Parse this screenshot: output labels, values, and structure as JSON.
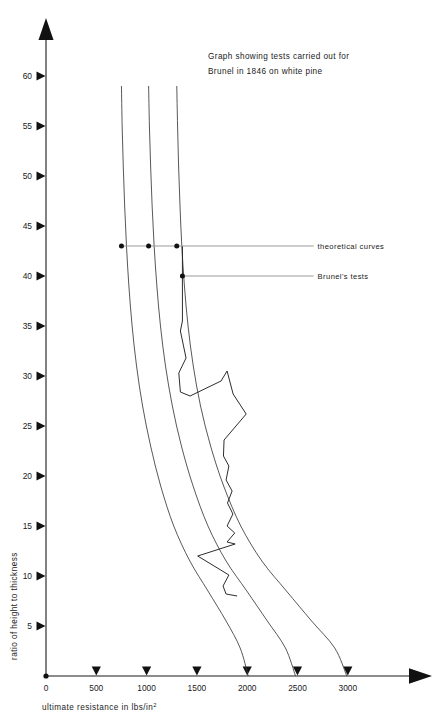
{
  "chart_data": {
    "type": "line",
    "title": "Graph showing tests carried out for Brunel in 1846 on white pine",
    "title_line1": "Graph showing tests carried out for",
    "title_line2": "Brunel in 1846 on white pine",
    "xlabel": "ultimate resistance in  lbs/in",
    "xlabel_sup": "2",
    "ylabel": "ratio of height to thickness",
    "xlim": [
      0,
      3200
    ],
    "ylim": [
      0,
      62
    ],
    "xticks": [
      0,
      500,
      1000,
      1500,
      2000,
      2500,
      3000
    ],
    "xtick_labels": [
      "0",
      "500",
      "1000",
      "1500",
      "2000",
      "2500",
      "3000"
    ],
    "yticks": [
      5,
      10,
      15,
      20,
      25,
      30,
      35,
      40,
      45,
      50,
      55,
      60
    ],
    "ytick_labels": [
      "5",
      "10",
      "15",
      "20",
      "25",
      "30",
      "35",
      "40",
      "45",
      "50",
      "55",
      "60"
    ],
    "grid": false,
    "legend": "annotated leader lines",
    "series": [
      {
        "name": "theoretical curve 1",
        "kind": "theoretical",
        "points": [
          [
            750,
            59.0
          ],
          [
            757,
            55.0
          ],
          [
            768,
            51.0
          ],
          [
            782,
            47.0
          ],
          [
            800,
            43.0
          ],
          [
            824,
            39.0
          ],
          [
            856,
            35.0
          ],
          [
            900,
            31.0
          ],
          [
            960,
            27.0
          ],
          [
            1040,
            23.0
          ],
          [
            1140,
            19.0
          ],
          [
            1270,
            15.0
          ],
          [
            1430,
            11.5
          ],
          [
            1610,
            8.5
          ],
          [
            1790,
            5.5
          ],
          [
            1930,
            2.8
          ],
          [
            2010,
            0.0
          ]
        ]
      },
      {
        "name": "theoretical curve 2",
        "kind": "theoretical",
        "points": [
          [
            1020,
            59.0
          ],
          [
            1028,
            55.0
          ],
          [
            1040,
            51.0
          ],
          [
            1055,
            47.0
          ],
          [
            1075,
            43.0
          ],
          [
            1102,
            39.0
          ],
          [
            1138,
            35.0
          ],
          [
            1188,
            31.0
          ],
          [
            1256,
            27.0
          ],
          [
            1346,
            23.0
          ],
          [
            1462,
            19.0
          ],
          [
            1610,
            15.0
          ],
          [
            1790,
            11.5
          ],
          [
            1996,
            8.5
          ],
          [
            2200,
            5.5
          ],
          [
            2380,
            2.8
          ],
          [
            2480,
            0.0
          ]
        ]
      },
      {
        "name": "theoretical curve 3",
        "kind": "theoretical",
        "points": [
          [
            1300,
            59.0
          ],
          [
            1308,
            55.0
          ],
          [
            1318,
            51.0
          ],
          [
            1332,
            47.0
          ],
          [
            1350,
            43.0
          ],
          [
            1376,
            39.0
          ],
          [
            1412,
            35.0
          ],
          [
            1464,
            31.0
          ],
          [
            1536,
            27.0
          ],
          [
            1636,
            23.0
          ],
          [
            1766,
            19.0
          ],
          [
            1936,
            15.0
          ],
          [
            2146,
            11.5
          ],
          [
            2390,
            8.5
          ],
          [
            2640,
            5.5
          ],
          [
            2870,
            2.8
          ],
          [
            2990,
            0.0
          ]
        ]
      },
      {
        "name": "Brunel's tests",
        "kind": "measured",
        "points": [
          [
            1356,
            43.0
          ],
          [
            1356,
            35.5
          ],
          [
            1336,
            34.5
          ],
          [
            1392,
            31.8
          ],
          [
            1320,
            30.3
          ],
          [
            1336,
            28.4
          ],
          [
            1432,
            28.0
          ],
          [
            1740,
            29.5
          ],
          [
            1800,
            30.5
          ],
          [
            1860,
            28.2
          ],
          [
            1990,
            26.2
          ],
          [
            1770,
            23.6
          ],
          [
            1764,
            22.0
          ],
          [
            1818,
            21.0
          ],
          [
            1790,
            19.6
          ],
          [
            1850,
            18.5
          ],
          [
            1804,
            17.3
          ],
          [
            1858,
            16.2
          ],
          [
            1800,
            15.0
          ],
          [
            1876,
            14.3
          ],
          [
            1800,
            13.4
          ],
          [
            1880,
            13.2
          ],
          [
            1508,
            12.0
          ],
          [
            1818,
            10.1
          ],
          [
            1760,
            9.0
          ],
          [
            1790,
            8.2
          ],
          [
            1900,
            8.0
          ]
        ]
      }
    ],
    "annotations": [
      {
        "label": "theoretical curves",
        "ratio": 43.0,
        "dot_values": [
          750,
          1020,
          1300
        ],
        "label_x": 2700
      },
      {
        "label": "Brunel's tests",
        "ratio": 40.0,
        "dot_values": [
          1356
        ],
        "label_x": 2700
      }
    ]
  }
}
